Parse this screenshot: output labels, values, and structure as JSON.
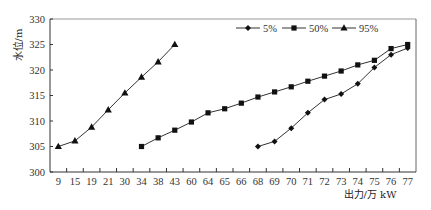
{
  "chart_data": {
    "type": "line",
    "title": "",
    "xlabel": "出力/万 kW",
    "ylabel": "水位/m",
    "categories": [
      "9",
      "15",
      "19",
      "21",
      "30",
      "34",
      "38",
      "43",
      "60",
      "64",
      "65",
      "66",
      "68",
      "69",
      "70",
      "71",
      "72",
      "73",
      "74",
      "75",
      "76",
      "77"
    ],
    "ylim": [
      300,
      330
    ],
    "yticks": [
      300,
      305,
      310,
      315,
      320,
      325,
      330
    ],
    "grid": false,
    "legend_position": "top-right",
    "series": [
      {
        "name": "5%",
        "marker": "diamond",
        "x": [
          "68",
          "69",
          "70",
          "71",
          "72",
          "73",
          "74",
          "75",
          "76",
          "77"
        ],
        "values": [
          305,
          306,
          308.6,
          311.6,
          314.2,
          315.3,
          317.3,
          320.5,
          323,
          324.3
        ]
      },
      {
        "name": "50%",
        "marker": "square",
        "x": [
          "34",
          "38",
          "43",
          "60",
          "64",
          "65",
          "66",
          "68",
          "69",
          "70",
          "71",
          "72",
          "73",
          "74",
          "75",
          "76",
          "77"
        ],
        "values": [
          305,
          306.7,
          308.2,
          309.8,
          311.6,
          312.4,
          313.5,
          314.7,
          315.7,
          316.7,
          317.8,
          318.8,
          319.8,
          321,
          321.9,
          324.2,
          325
        ]
      },
      {
        "name": "95%",
        "marker": "triangle",
        "x": [
          "9",
          "15",
          "19",
          "21",
          "30",
          "34",
          "38",
          "43"
        ],
        "values": [
          305,
          306.1,
          308.8,
          312.2,
          315.5,
          318.6,
          321.6,
          325
        ]
      }
    ]
  }
}
